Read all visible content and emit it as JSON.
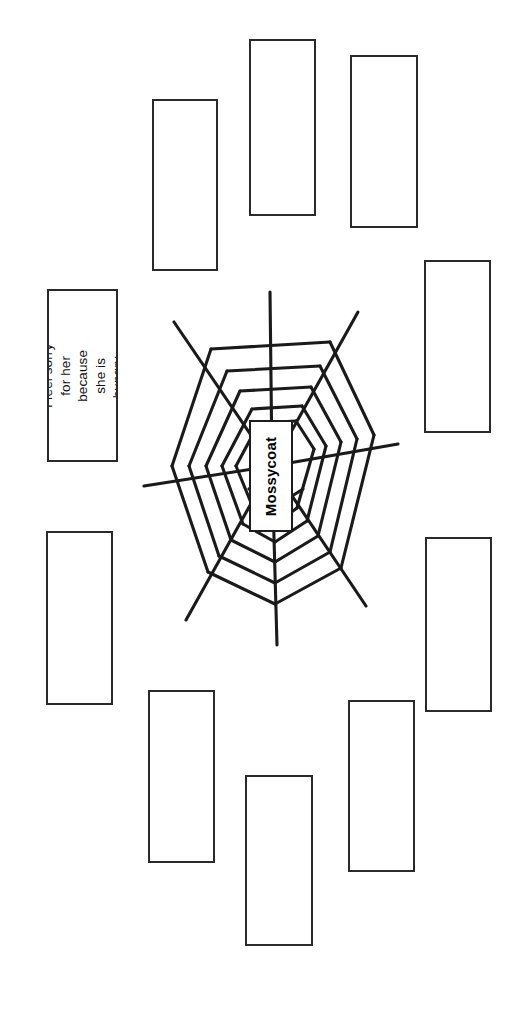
{
  "page": {
    "width": 527,
    "height": 1016,
    "background": "#ffffff",
    "orientation": "landscape-rotated"
  },
  "web": {
    "name": "spider-web-diagram",
    "center_label": "Mossycoat",
    "stroke_color": "#1a1a1a",
    "center_x": 272,
    "center_y": 466,
    "spoke_count": 8,
    "ring_count": 6,
    "description": "Radial spider-web graphic organizer with eight spokes and six concentric polygon rings around a central name box"
  },
  "boxes": [
    {
      "id": "note-filled-left",
      "name": "response-box-filled",
      "text": "I feel sorry for her\nbecause she is\nhungry.",
      "filled": true,
      "x": 47,
      "y": 289,
      "w": 71,
      "h": 173
    },
    {
      "id": "note-top-1",
      "name": "response-box-empty",
      "text": "",
      "filled": false,
      "x": 152,
      "y": 99,
      "w": 66,
      "h": 172
    },
    {
      "id": "note-top-2",
      "name": "response-box-empty",
      "text": "",
      "filled": false,
      "x": 249,
      "y": 39,
      "w": 67,
      "h": 177
    },
    {
      "id": "note-top-3",
      "name": "response-box-empty",
      "text": "",
      "filled": false,
      "x": 350,
      "y": 55,
      "w": 68,
      "h": 173
    },
    {
      "id": "note-right-1",
      "name": "response-box-empty",
      "text": "",
      "filled": false,
      "x": 424,
      "y": 260,
      "w": 67,
      "h": 173
    },
    {
      "id": "note-right-2",
      "name": "response-box-empty",
      "text": "",
      "filled": false,
      "x": 425,
      "y": 537,
      "w": 67,
      "h": 175
    },
    {
      "id": "note-left-bottom",
      "name": "response-box-empty",
      "text": "",
      "filled": false,
      "x": 46,
      "y": 531,
      "w": 67,
      "h": 174
    },
    {
      "id": "note-bottom-1",
      "name": "response-box-empty",
      "text": "",
      "filled": false,
      "x": 148,
      "y": 690,
      "w": 67,
      "h": 173
    },
    {
      "id": "note-bottom-2",
      "name": "response-box-empty",
      "text": "",
      "filled": false,
      "x": 245,
      "y": 775,
      "w": 68,
      "h": 171
    },
    {
      "id": "note-bottom-3",
      "name": "response-box-empty",
      "text": "",
      "filled": false,
      "x": 348,
      "y": 700,
      "w": 67,
      "h": 172
    }
  ],
  "center_box": {
    "name": "center-name-box",
    "label": "Mossycoat",
    "x": 249,
    "y": 420,
    "w": 44,
    "h": 112
  }
}
